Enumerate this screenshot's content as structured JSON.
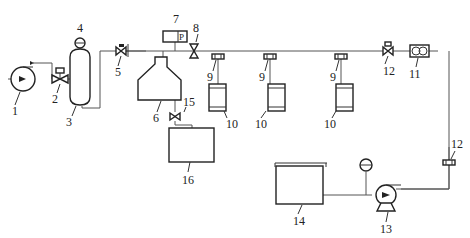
{
  "diagram": {
    "top_text_fragment": "",
    "components": [
      {
        "id": "1",
        "label": "1",
        "type": "pump"
      },
      {
        "id": "2",
        "label": "2",
        "type": "valve"
      },
      {
        "id": "3",
        "label": "3",
        "type": "vessel"
      },
      {
        "id": "4",
        "label": "4",
        "type": "pressure-gauge"
      },
      {
        "id": "5",
        "label": "5",
        "type": "valve"
      },
      {
        "id": "6",
        "label": "6",
        "type": "hopper-tank"
      },
      {
        "id": "7",
        "label": "7",
        "type": "pressure-sensor",
        "symbol": "P"
      },
      {
        "id": "8",
        "label": "8",
        "type": "valve"
      },
      {
        "id": "9a",
        "label": "9",
        "type": "valve"
      },
      {
        "id": "9b",
        "label": "9",
        "type": "valve"
      },
      {
        "id": "9c",
        "label": "9",
        "type": "valve"
      },
      {
        "id": "10a",
        "label": "10",
        "type": "canister"
      },
      {
        "id": "10b",
        "label": "10",
        "type": "canister"
      },
      {
        "id": "10c",
        "label": "10",
        "type": "canister"
      },
      {
        "id": "11",
        "label": "11",
        "type": "flow-meter"
      },
      {
        "id": "12a",
        "label": "12",
        "type": "valve"
      },
      {
        "id": "12b",
        "label": "12",
        "type": "valve"
      },
      {
        "id": "13",
        "label": "13",
        "type": "pump"
      },
      {
        "id": "14",
        "label": "14",
        "type": "tank"
      },
      {
        "id": "15",
        "label": "15",
        "type": "valve"
      },
      {
        "id": "16",
        "label": "16",
        "type": "tank"
      }
    ],
    "labels": {
      "l1": "1",
      "l2": "2",
      "l3": "3",
      "l4": "4",
      "l5": "5",
      "l6": "6",
      "l7": "7",
      "l7p": "P",
      "l8": "8",
      "l9a": "9",
      "l9b": "9",
      "l9c": "9",
      "l10a": "10",
      "l10b": "10",
      "l10c": "10",
      "l11": "11",
      "l12a": "12",
      "l12b": "12",
      "l13": "13",
      "l14": "14",
      "l15": "15",
      "l16": "16"
    }
  }
}
